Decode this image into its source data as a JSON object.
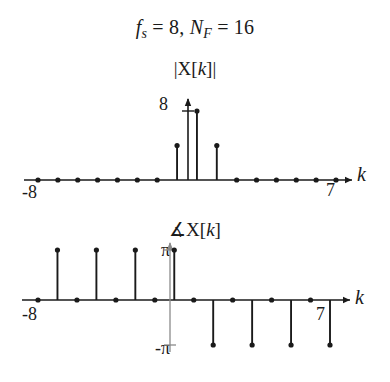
{
  "figure": {
    "title_parts": {
      "f": "f",
      "f_sub": "s",
      "eq1": " = 8, ",
      "N": "N",
      "N_sub": "F",
      "eq2": " = 16"
    },
    "title_plain": "f_s = 8, N_F = 16",
    "background_color": "#ffffff",
    "ink_color": "#1a1a1a"
  },
  "plots": [
    {
      "id": "magnitude",
      "ylabel": "|X[k]|",
      "xlabel": "k",
      "ytick_labels": [
        "8"
      ],
      "xtick_labels": {
        "left": "-8",
        "right": "7"
      }
    },
    {
      "id": "phase",
      "ylabel": "∡X[k]",
      "xlabel": "k",
      "ytick_labels": [
        "π",
        "-π"
      ],
      "xtick_labels": {
        "left": "-8",
        "right": "7"
      }
    }
  ],
  "chart_data": [
    {
      "type": "stem",
      "id": "magnitude-spectrum",
      "title": "|X[k]|",
      "xlabel": "k",
      "ylabel": "|X[k]|",
      "xlim": [
        -8,
        7
      ],
      "ylim": [
        0,
        8
      ],
      "grid": false,
      "legend": null,
      "x": [
        -8,
        -7,
        -6,
        -5,
        -4,
        -3,
        -2,
        -1,
        0,
        1,
        2,
        3,
        4,
        5,
        6,
        7
      ],
      "values": [
        0,
        0,
        0,
        0,
        0,
        0,
        0,
        4,
        8,
        4,
        0,
        0,
        0,
        0,
        0,
        0
      ],
      "ytick_values": [
        8
      ],
      "ytick_labels": [
        "8"
      ],
      "xtick_values": [
        -8,
        7
      ],
      "xtick_labels": [
        "-8",
        "7"
      ]
    },
    {
      "type": "stem",
      "id": "phase-spectrum",
      "title": "∡X[k]",
      "xlabel": "k",
      "ylabel": "∡X[k]",
      "xlim": [
        -8,
        7
      ],
      "ylim": [
        -3.1416,
        3.1416
      ],
      "grid": false,
      "legend": null,
      "x": [
        -8,
        -7,
        -6,
        -5,
        -4,
        -3,
        -2,
        -1,
        0,
        1,
        2,
        3,
        4,
        5,
        6,
        7
      ],
      "values": [
        0,
        3.1416,
        0,
        3.1416,
        0,
        3.1416,
        0,
        3.1416,
        0,
        -3.1416,
        0,
        -3.1416,
        0,
        -3.1416,
        0,
        -3.1416
      ],
      "ytick_values": [
        3.1416,
        -3.1416
      ],
      "ytick_labels": [
        "π",
        "-π"
      ],
      "xtick_values": [
        -8,
        7
      ],
      "xtick_labels": [
        "-8",
        "7"
      ]
    }
  ]
}
